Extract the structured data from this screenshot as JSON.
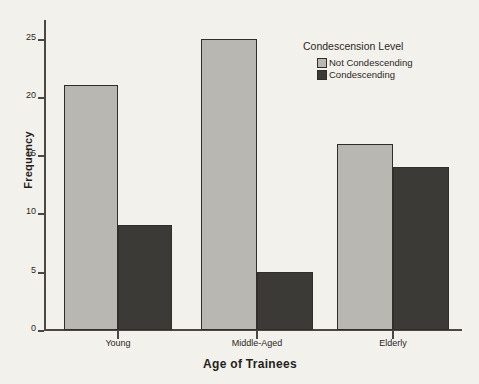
{
  "chart_data": {
    "type": "bar",
    "title": "",
    "xlabel": "Age of Trainees",
    "ylabel": "Frequency",
    "categories": [
      "Young",
      "Middle-Aged",
      "Elderly"
    ],
    "series": [
      {
        "name": "Not Condescending",
        "color": "#b9b7b2",
        "values": [
          21,
          25,
          16
        ]
      },
      {
        "name": "Condescending",
        "color": "#3b3a37",
        "values": [
          9,
          5,
          14
        ]
      }
    ],
    "ylim": [
      0,
      26
    ],
    "yticks": [
      0,
      5,
      10,
      15,
      20,
      25
    ],
    "ytick_labels": [
      "0",
      "5",
      "10",
      "15",
      "20",
      "25"
    ],
    "grid": false,
    "legend": {
      "title": "Condescension Level",
      "position": "inside-top-right",
      "entries": [
        {
          "label": "Not Condescending",
          "color": "#b9b7b2"
        },
        {
          "label": "Condescending",
          "color": "#3b3a37"
        }
      ]
    },
    "background_color": "#f3f1ec",
    "axis_color": "#4b4844",
    "bar_edge_color": "#302d2a"
  }
}
